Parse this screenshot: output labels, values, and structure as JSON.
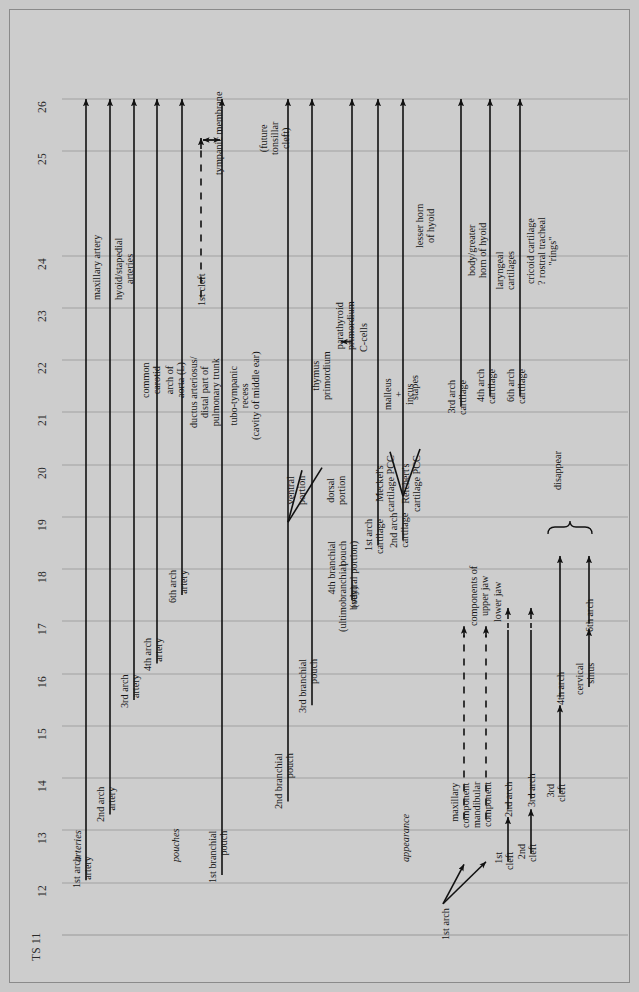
{
  "figure": {
    "type": "timeline",
    "axis_name": "TS",
    "axis_orientation": "vertical-rotated",
    "background_color": "#cdcdcd",
    "line_color": "#111111",
    "gridline_color": "#9a9a9a"
  },
  "axis": {
    "ticks": [
      {
        "label": "TS 11",
        "value": 11,
        "y": 935
      },
      {
        "label": "12",
        "value": 12,
        "y": 883
      },
      {
        "label": "13",
        "value": 13,
        "y": 830
      },
      {
        "label": "14",
        "value": 14,
        "y": 778
      },
      {
        "label": "15",
        "value": 15,
        "y": 726
      },
      {
        "label": "16",
        "value": 16,
        "y": 674
      },
      {
        "label": "17",
        "value": 17,
        "y": 621
      },
      {
        "label": "18",
        "value": 18,
        "y": 569
      },
      {
        "label": "19",
        "value": 19,
        "y": 517
      },
      {
        "label": "20",
        "value": 20,
        "y": 465
      },
      {
        "label": "21",
        "value": 21,
        "y": 412
      },
      {
        "label": "22",
        "value": 22,
        "y": 360
      },
      {
        "label": "23",
        "value": 23,
        "y": 308
      },
      {
        "label": "24",
        "value": 24,
        "y": 256
      },
      {
        "label": "25",
        "value": 25,
        "y": 151
      },
      {
        "label": "26",
        "value": 26,
        "y": 99
      }
    ],
    "tick_values_ordered": [
      11,
      12,
      13,
      14,
      15,
      16,
      17,
      18,
      19,
      20,
      21,
      22,
      23,
      24,
      25,
      26
    ]
  },
  "section_headings": [
    {
      "label": "arteries",
      "x": 72,
      "y": 862
    },
    {
      "label": "pouches",
      "x": 170,
      "y": 862
    },
    {
      "label": "appearance",
      "x": 400,
      "y": 862
    }
  ],
  "tracks": [
    {
      "name": "1st arch artery",
      "label": "1st arch\nartery",
      "x": 86,
      "start": 12.05,
      "end": 26,
      "style": "solid",
      "arrow": "up"
    },
    {
      "name": "2nd arch artery",
      "label": "2nd arch\nartery",
      "x": 110,
      "start": 13.3,
      "end": 26,
      "style": "solid",
      "arrow": "up"
    },
    {
      "name": "3rd arch artery",
      "label": "3rd arch\nartery",
      "x": 134,
      "start": 15.5,
      "end": 26,
      "style": "solid",
      "arrow": "up"
    },
    {
      "name": "4th arch artery",
      "label": "4th arch\nartery",
      "x": 157,
      "start": 16.2,
      "end": 26,
      "style": "solid",
      "arrow": "up"
    },
    {
      "name": "6th arch artery",
      "label": "6th arch\nartery",
      "x": 182,
      "start": 17.5,
      "end": 26,
      "style": "solid",
      "arrow": "up"
    },
    {
      "name": "1st cleft",
      "label": "1st cleft",
      "x": 201,
      "start": 23.2,
      "end": 25.25,
      "style": "dashed",
      "arrow": "up"
    },
    {
      "name": "1st branchial pouch",
      "label": "1st branchial\npouch",
      "x": 222,
      "start": 12.15,
      "end": 26,
      "style": "solid",
      "arrow": "up"
    },
    {
      "name": "2nd branchial pouch",
      "label": "2nd branchial\npouch",
      "x": 288,
      "start": 13.55,
      "end": 26,
      "style": "solid",
      "arrow": "up"
    },
    {
      "name": "3rd branchial pouch",
      "label": "3rd branchial\npouch",
      "x": 312,
      "start": 15.4,
      "end": 26,
      "style": "solid",
      "arrow": "up"
    },
    {
      "name": "4th branchial pouch",
      "label": "4th branchial\npouch\n(ventral portion)",
      "x": 352,
      "start": 17.4,
      "end": 26,
      "style": "solid",
      "arrow": "up"
    },
    {
      "name": "1st arch cartilage",
      "label": "1st arch\ncartilage",
      "x": 378,
      "start": 18.45,
      "end": 26,
      "style": "solid",
      "arrow": "up"
    },
    {
      "name": "2nd arch cartilage",
      "label": "2nd arch\ncartilage",
      "x": 403,
      "start": 18.55,
      "end": 26,
      "style": "solid",
      "arrow": "up"
    },
    {
      "name": "3rd arch cartilage",
      "label": "3rd arch\ncartilage",
      "x": 461,
      "start": 21.1,
      "end": 26,
      "style": "solid",
      "arrow": "up"
    },
    {
      "name": "4th arch cartilage",
      "label": "4th arch\ncartilage",
      "x": 490,
      "start": 21.3,
      "end": 26,
      "style": "solid",
      "arrow": "up"
    },
    {
      "name": "6th arch cartilage",
      "label": "6th arch\ncartilage",
      "x": 520,
      "start": 21.3,
      "end": 26,
      "style": "solid",
      "arrow": "up"
    },
    {
      "name": "maxillary component",
      "label": "maxillary\ncomponent",
      "x": 464,
      "start": 13.2,
      "end": 16.9,
      "style": "dashed",
      "arrow": "up"
    },
    {
      "name": "mandibular component",
      "label": "mandibular\ncomponent",
      "x": 486,
      "start": 13.2,
      "end": 16.9,
      "style": "dashed",
      "arrow": "up"
    },
    {
      "name": "2nd arch",
      "label": "2nd arch",
      "x": 508,
      "start": 13.4,
      "end": 17.25,
      "style": "solid-dashtip",
      "arrow": "up"
    },
    {
      "name": "3rd arch",
      "label": "3rd arch",
      "x": 531,
      "start": 13.6,
      "end": 17.25,
      "style": "solid-dashtip",
      "arrow": "up"
    },
    {
      "name": "1st cleft appearance",
      "label": "1st\ncleft",
      "x": 508,
      "start": 12.4,
      "end": 13.25,
      "style": "solid",
      "arrow": "up"
    },
    {
      "name": "2nd cleft appearance",
      "label": "2nd\ncleft",
      "x": 531,
      "start": 12.55,
      "end": 13.4,
      "style": "solid",
      "arrow": "up"
    },
    {
      "name": "3rd cleft appearance",
      "label": "3rd\ncleft",
      "x": 560,
      "start": 13.7,
      "end": 15.4,
      "style": "solid",
      "arrow": "up"
    },
    {
      "name": "4th arch",
      "label": "4th arch",
      "x": 560,
      "start": 15.55,
      "end": 18.25,
      "style": "solid",
      "arrow": "up"
    },
    {
      "name": "cervical sinus",
      "label": "cervical\nsinus",
      "x": 589,
      "start": 15.75,
      "end": 16.85,
      "style": "solid",
      "arrow": "up"
    },
    {
      "name": "6th arch",
      "label": "6th arch",
      "x": 589,
      "start": 16.95,
      "end": 18.25,
      "style": "solid",
      "arrow": "up"
    }
  ],
  "annotations": [
    {
      "name": "maxillary-artery",
      "text": "maxillary artery",
      "x": 91,
      "y": 300,
      "rot": -90
    },
    {
      "name": "hyoid-stapedial",
      "text": "hyoid/stapedial\narteries",
      "x": 113,
      "y": 300,
      "rot": -90
    },
    {
      "name": "common-carotid",
      "text": "common\ncarotid",
      "x": 140,
      "y": 398,
      "rot": -90
    },
    {
      "name": "arch-of-aorta",
      "text": "arch of\naorta (L)",
      "x": 164,
      "y": 398,
      "rot": -90
    },
    {
      "name": "ductus-arteriosus",
      "text": "ductus arteriosus/\ndistal part of\npulmonary trunk",
      "x": 188,
      "y": 428,
      "rot": -90
    },
    {
      "name": "tubo-tympanic-recess",
      "text": "tubo-tympanic\nrecess\n(cavity of middle ear)",
      "x": 228,
      "y": 440,
      "rot": -90
    },
    {
      "name": "tympanic-membrane",
      "text": "tympanic membrane",
      "x": 213,
      "y": 175,
      "rot": -90
    },
    {
      "name": "future-tonsillar-cleft",
      "text": "(future\ntonsillar\ncleft)",
      "x": 258,
      "y": 155,
      "rot": -90
    },
    {
      "name": "thymus-primordium",
      "text": "thymus\nprimordium",
      "x": 310,
      "y": 400,
      "rot": -90
    },
    {
      "name": "parathyroid-primordium",
      "text": "parathyroid\nprimordium",
      "x": 334,
      "y": 350,
      "rot": -90
    },
    {
      "name": "ventral-portion",
      "text": "ventral\nportion",
      "x": 285,
      "y": 505,
      "rot": -90
    },
    {
      "name": "dorsal-portion",
      "text": "dorsal\nportion",
      "x": 325,
      "y": 505,
      "rot": -90
    },
    {
      "name": "c-cells",
      "text": "C-cells",
      "x": 358,
      "y": 352,
      "rot": -90
    },
    {
      "name": "ultimobranchial-body",
      "text": "(ultimobranchial\nbody)",
      "x": 337,
      "y": 632,
      "rot": -90
    },
    {
      "name": "meckels-cartilage",
      "text": "Meckel's\ncartilage PCC",
      "x": 374,
      "y": 512,
      "rot": -90
    },
    {
      "name": "reicherts-cartilage",
      "text": "Reichert's\ncartilage PCC",
      "x": 400,
      "y": 512,
      "rot": -90
    },
    {
      "name": "malleus-incus",
      "text": "malleus\n+\nincus",
      "x": 382,
      "y": 410,
      "rot": -90
    },
    {
      "name": "stapes",
      "text": "stapes",
      "x": 409,
      "y": 400,
      "rot": -90
    },
    {
      "name": "lesser-horn-of-hyoid",
      "text": "lesser horn\nof hyoid",
      "x": 414,
      "y": 248,
      "rot": -90
    },
    {
      "name": "body-greater-horn",
      "text": "body/greater\nhorn of hyoid",
      "x": 466,
      "y": 278,
      "rot": -90
    },
    {
      "name": "laryngeal-cartilages",
      "text": "laryngeal\ncartilages",
      "x": 494,
      "y": 290,
      "rot": -90
    },
    {
      "name": "cricoid-cartilage",
      "text": "cricoid cartilage\n? rostral tracheal\n\"rings\"",
      "x": 525,
      "y": 285,
      "rot": -90
    },
    {
      "name": "components-of-upper-jaw",
      "text": "components of\nupper jaw",
      "x": 468,
      "y": 626,
      "rot": -90
    },
    {
      "name": "lower-jaw",
      "text": "lower jaw",
      "x": 492,
      "y": 622,
      "rot": -90
    },
    {
      "name": "first-arch-origin",
      "text": "1st arch",
      "x": 440,
      "y": 940,
      "rot": -90
    },
    {
      "name": "disappear",
      "text": "disappear",
      "x": 552,
      "y": 490,
      "rot": -90
    }
  ],
  "brackets": [
    {
      "name": "disappear-bracket",
      "from_x": 548,
      "to_x": 592,
      "y": 527,
      "label": "disappear"
    }
  ],
  "measure_arrows": [
    {
      "name": "first-cleft-to-tympanic-span",
      "x": 201,
      "to_x": 222,
      "y": 140
    }
  ]
}
